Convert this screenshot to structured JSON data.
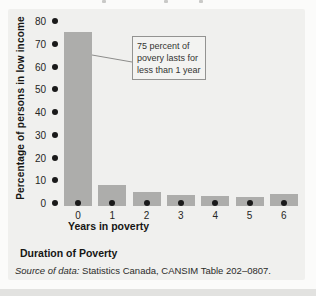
{
  "page": {
    "outer_bg": "#fbfbfa",
    "panel_bg": "#f0f0ee",
    "bottom_strip_color": "#e2e2e0"
  },
  "chart_data": {
    "type": "bar",
    "title": "",
    "categories": [
      "0",
      "1",
      "2",
      "3",
      "4",
      "5",
      "6"
    ],
    "values": [
      75,
      8,
      5,
      3.5,
      3,
      2.5,
      4
    ],
    "xlabel": "Years in poverty",
    "ylabel": "Percentage of persons in low income",
    "ylim": [
      0,
      80
    ],
    "yticks": [
      0,
      10,
      20,
      30,
      40,
      50,
      60,
      70,
      80
    ],
    "grid": false,
    "legend": false,
    "bar_color": "#adadab",
    "tick_marker_color": "#1a1a1a",
    "annotation": {
      "lines": [
        "75 percent of",
        "povery lasts for",
        "less than 1 year"
      ],
      "points_to_category": "0"
    }
  },
  "figure": {
    "caption": "Duration of Poverty",
    "source_label": "Source of data:",
    "source_text": " Statistics Canada, CANSIM Table 202–0807."
  }
}
